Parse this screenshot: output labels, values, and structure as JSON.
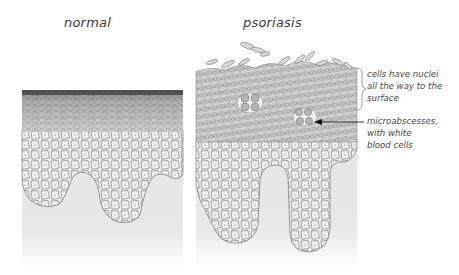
{
  "titles": {
    "normal": "normal",
    "psoriasis": "psoriasis"
  },
  "annotations": {
    "nuclei": [
      "cells have nuclei",
      "all the way to the",
      "surface"
    ],
    "microabscesses": [
      "microabscesses,",
      "with white",
      "blood cells"
    ]
  },
  "colors": {
    "background": "#ffffff",
    "dermis": "#e6e6e6",
    "cell_fill": "#eeeeee",
    "cell_stroke": "#555555",
    "text": "#444444"
  }
}
